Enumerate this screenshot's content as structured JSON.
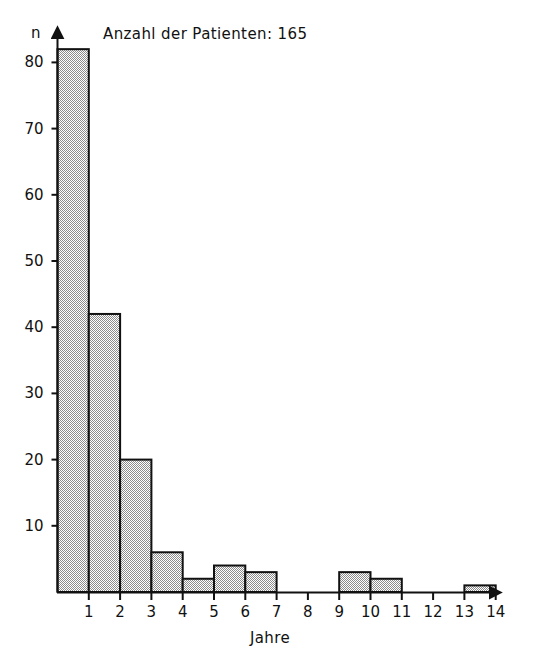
{
  "chart_data": {
    "type": "bar",
    "title": "Anzahl der Patienten: 165",
    "xlabel": "Jahre",
    "ylabel": "n",
    "categories": [
      "0-1",
      "1-2",
      "2-3",
      "3-4",
      "4-5",
      "5-6",
      "6-7",
      "7-8",
      "8-9",
      "9-10",
      "10-11",
      "11-12",
      "12-13",
      "13-14"
    ],
    "bin_starts": [
      0,
      1,
      2,
      3,
      4,
      5,
      6,
      7,
      8,
      9,
      10,
      11,
      12,
      13
    ],
    "bin_ends": [
      1,
      2,
      3,
      4,
      5,
      6,
      7,
      8,
      9,
      10,
      11,
      12,
      13,
      14
    ],
    "values": [
      82,
      42,
      20,
      6,
      2,
      4,
      3,
      0,
      0,
      3,
      2,
      0,
      0,
      1
    ],
    "total": 165,
    "xlim": [
      0,
      14
    ],
    "ylim": [
      0,
      85
    ],
    "x_tick_labels": [
      "1",
      "2",
      "3",
      "4",
      "5",
      "6",
      "7",
      "8",
      "9",
      "10",
      "11",
      "12",
      "13",
      "14"
    ],
    "x_tick_values": [
      1,
      2,
      3,
      4,
      5,
      6,
      7,
      8,
      9,
      10,
      11,
      12,
      13,
      14
    ],
    "y_tick_labels": [
      "10",
      "20",
      "30",
      "40",
      "50",
      "60",
      "70",
      "80"
    ],
    "y_tick_values": [
      10,
      20,
      30,
      40,
      50,
      60,
      70,
      80
    ],
    "grid": false,
    "legend": "none",
    "bar_fill": "#b5b5b5",
    "bar_edge": "#111111",
    "axis_color": "#111111",
    "background": "#ffffff",
    "axis_arrows": true
  }
}
